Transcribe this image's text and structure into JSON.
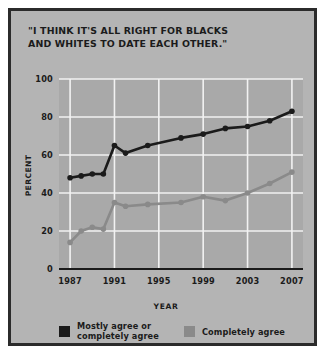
{
  "chart_data": {
    "type": "line",
    "title": "\"I THINK IT'S ALL RIGHT FOR BLACKS\nAND WHITES TO DATE EACH OTHER.\"",
    "xlabel": "YEAR",
    "ylabel": "PERCENT",
    "xlim": [
      1986,
      2008
    ],
    "ylim": [
      0,
      100
    ],
    "grid": true,
    "legend_position": "bottom",
    "yticks": [
      0,
      20,
      40,
      60,
      80,
      100
    ],
    "xticks": [
      1987,
      1991,
      1995,
      1999,
      2003,
      2007
    ],
    "x": [
      1987,
      1988,
      1989,
      1990,
      1991,
      1992,
      1994,
      1997,
      1999,
      2001,
      2003,
      2005,
      2007
    ],
    "series": [
      {
        "name": "Mostly agree or\ncompletely agree",
        "color": "#1b1b1b",
        "values": [
          48,
          49,
          50,
          50,
          65,
          61,
          65,
          69,
          71,
          74,
          75,
          78,
          83
        ]
      },
      {
        "name": "Completely agree",
        "color": "#8a8a8a",
        "values": [
          14,
          20,
          22,
          21,
          35,
          33,
          34,
          35,
          38,
          36,
          40,
          45,
          51
        ]
      }
    ]
  },
  "legend": {
    "items": [
      {
        "label": "Mostly agree or\ncompletely agree",
        "color": "#1b1b1b"
      },
      {
        "label": "Completely agree",
        "color": "#8a8a8a"
      }
    ]
  },
  "colors": {
    "background": "#b4b4b4",
    "frame": "#2b2b2b",
    "plot_background": "#a9a9a9",
    "grid": "#f2f2f2",
    "axis": "#1b1b1b",
    "series_dark": "#1b1b1b",
    "series_gray": "#8a8a8a"
  }
}
